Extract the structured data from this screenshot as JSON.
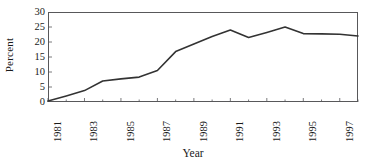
{
  "chart_data": {
    "type": "line",
    "title": "",
    "xlabel": "Year",
    "ylabel": "Percent",
    "xlim": [
      1981,
      1998
    ],
    "ylim": [
      0,
      30
    ],
    "yticks": [
      0,
      5,
      10,
      15,
      20,
      25,
      30
    ],
    "ytick_labels": [
      "0",
      "5",
      "10",
      "15",
      "20",
      "25",
      "30"
    ],
    "xticks": [
      1981,
      1983,
      1985,
      1987,
      1989,
      1991,
      1993,
      1995,
      1997
    ],
    "xtick_labels": [
      "1981",
      "1983",
      "1985",
      "1987",
      "1989",
      "1991",
      "1993",
      "1995",
      "1997"
    ],
    "minor_xticks": [
      1982,
      1984,
      1986,
      1988,
      1990,
      1992,
      1994,
      1996,
      1998
    ],
    "grid": false,
    "legend": null,
    "line_color": "#333333",
    "frame_color": "#58585a",
    "x": [
      1981,
      1982,
      1983,
      1984,
      1985,
      1986,
      1987,
      1988,
      1989,
      1990,
      1991,
      1992,
      1993,
      1994,
      1995,
      1996,
      1997,
      1998
    ],
    "values": [
      0.3,
      2.0,
      3.8,
      7.0,
      7.7,
      8.3,
      10.5,
      16.8,
      19.3,
      21.8,
      24.0,
      21.5,
      23.2,
      25.0,
      22.8,
      22.7,
      22.6,
      22.0
    ],
    "series": [
      {
        "name": "Percent",
        "values": [
          0.3,
          2.0,
          3.8,
          7.0,
          7.7,
          8.3,
          10.5,
          16.8,
          19.3,
          21.8,
          24.0,
          21.5,
          23.2,
          25.0,
          22.8,
          22.7,
          22.6,
          22.0
        ]
      }
    ]
  }
}
